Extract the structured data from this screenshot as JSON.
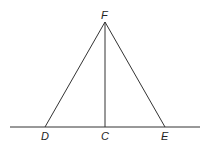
{
  "diagram": {
    "type": "geometry-figure",
    "points": {
      "F": "apex",
      "D": "base-left",
      "C": "foot-of-altitude",
      "E": "base-right"
    },
    "labels": {
      "F": "F",
      "D": "D",
      "C": "C",
      "E": "E"
    },
    "segments": [
      "FD",
      "FE",
      "FC",
      "baseline through D, C, E"
    ],
    "line_color": "#333333"
  }
}
